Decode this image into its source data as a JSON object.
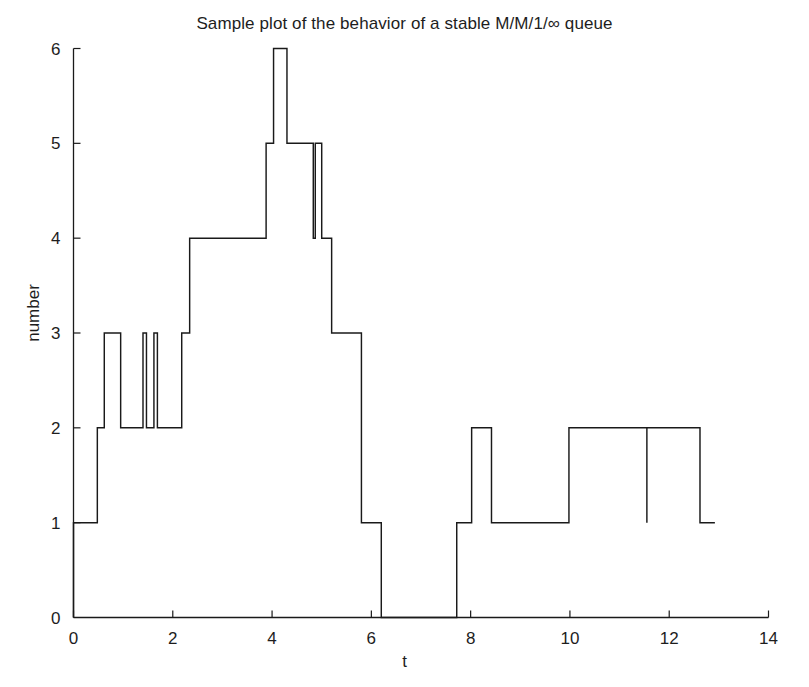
{
  "figure": {
    "width": 809,
    "height": 687,
    "background": "#ffffff",
    "line_color": "#1a1a1a",
    "axis_color": "#1a1a1a"
  },
  "chart_data": {
    "type": "line",
    "subtype": "step-post",
    "title": "Sample plot of the behavior of a stable M/M/1/∞ queue",
    "xlabel": "t",
    "ylabel": "number",
    "xlim": [
      0,
      14
    ],
    "ylim": [
      0,
      6
    ],
    "xticks": [
      0,
      2,
      4,
      6,
      8,
      10,
      12,
      14
    ],
    "xtick_labels": [
      "0",
      "2",
      "4",
      "6",
      "8",
      "10",
      "12",
      "14"
    ],
    "yticks": [
      0,
      1,
      2,
      3,
      4,
      5,
      6
    ],
    "ytick_labels": [
      "0",
      "1",
      "2",
      "3",
      "4",
      "5",
      "6"
    ],
    "grid": false,
    "legend": null,
    "series": [
      {
        "name": "queue length",
        "x": [
          0.0,
          0.0,
          0.48,
          0.62,
          0.95,
          1.4,
          1.47,
          1.62,
          1.69,
          2.18,
          2.34,
          3.88,
          4.03,
          4.3,
          4.7,
          4.83,
          4.87,
          5.0,
          5.2,
          5.8,
          6.2,
          7.72,
          8.02,
          8.42,
          9.98,
          11.55,
          11.55,
          12.62,
          12.92
        ],
        "y": [
          0,
          1,
          2,
          3,
          2,
          3,
          2,
          3,
          2,
          3,
          4,
          5,
          6,
          5,
          5,
          4,
          5,
          4,
          3,
          1,
          0,
          1,
          2,
          1,
          2,
          1,
          2,
          1,
          1
        ],
        "description": "Right-continuous step function of queue occupancy over time"
      }
    ],
    "steps": [
      {
        "t_start": 0.0,
        "t_end": 0.48,
        "value": 1
      },
      {
        "t_start": 0.48,
        "t_end": 0.62,
        "value": 2
      },
      {
        "t_start": 0.62,
        "t_end": 0.95,
        "value": 3
      },
      {
        "t_start": 0.95,
        "t_end": 1.4,
        "value": 2
      },
      {
        "t_start": 1.4,
        "t_end": 1.47,
        "value": 3
      },
      {
        "t_start": 1.47,
        "t_end": 1.62,
        "value": 2
      },
      {
        "t_start": 1.62,
        "t_end": 1.69,
        "value": 3
      },
      {
        "t_start": 1.69,
        "t_end": 2.18,
        "value": 2
      },
      {
        "t_start": 2.18,
        "t_end": 2.34,
        "value": 3
      },
      {
        "t_start": 2.34,
        "t_end": 3.88,
        "value": 4
      },
      {
        "t_start": 3.88,
        "t_end": 4.03,
        "value": 5
      },
      {
        "t_start": 4.03,
        "t_end": 4.3,
        "value": 6
      },
      {
        "t_start": 4.3,
        "t_end": 4.83,
        "value": 5
      },
      {
        "t_start": 4.83,
        "t_end": 4.87,
        "value": 4
      },
      {
        "t_start": 4.87,
        "t_end": 5.0,
        "value": 5
      },
      {
        "t_start": 5.0,
        "t_end": 5.2,
        "value": 4
      },
      {
        "t_start": 5.2,
        "t_end": 5.8,
        "value": 3
      },
      {
        "t_start": 5.8,
        "t_end": 6.2,
        "value": 1
      },
      {
        "t_start": 6.2,
        "t_end": 7.72,
        "value": 0
      },
      {
        "t_start": 7.72,
        "t_end": 8.02,
        "value": 1
      },
      {
        "t_start": 8.02,
        "t_end": 8.42,
        "value": 2
      },
      {
        "t_start": 8.42,
        "t_end": 9.98,
        "value": 1
      },
      {
        "t_start": 9.98,
        "t_end": 11.55,
        "value": 2
      },
      {
        "t_start": 11.55,
        "t_end": 11.55,
        "value": 1
      },
      {
        "t_start": 11.55,
        "t_end": 12.62,
        "value": 2
      },
      {
        "t_start": 12.62,
        "t_end": 12.92,
        "value": 1
      }
    ]
  }
}
